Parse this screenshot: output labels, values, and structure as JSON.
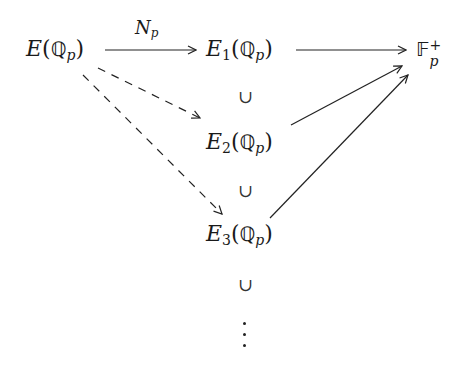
{
  "diagram": {
    "type": "commutative-diagram",
    "nodes": {
      "E": {
        "letter": "E",
        "subscript": "",
        "field": "ℚ",
        "field_sub": "p"
      },
      "E1": {
        "letter": "E",
        "subscript": "1",
        "field": "ℚ",
        "field_sub": "p"
      },
      "E2": {
        "letter": "E",
        "subscript": "2",
        "field": "ℚ",
        "field_sub": "p"
      },
      "E3": {
        "letter": "E",
        "subscript": "3",
        "field": "ℚ",
        "field_sub": "p"
      },
      "Fp": {
        "letter": "𝔽",
        "subscript": "p",
        "superscript": "+"
      }
    },
    "arrows": [
      {
        "from": "E",
        "to": "E1",
        "style": "solid",
        "label": "N",
        "label_sub": "p"
      },
      {
        "from": "E1",
        "to": "Fp",
        "style": "solid"
      },
      {
        "from": "E",
        "to": "E2",
        "style": "dashed"
      },
      {
        "from": "E",
        "to": "E3",
        "style": "dashed"
      },
      {
        "from": "E2",
        "to": "Fp",
        "style": "solid"
      },
      {
        "from": "E3",
        "to": "Fp",
        "style": "solid"
      }
    ],
    "inclusion_symbol": "∪",
    "continuation": "⋮",
    "paren_open": "(",
    "paren_close": ")"
  }
}
